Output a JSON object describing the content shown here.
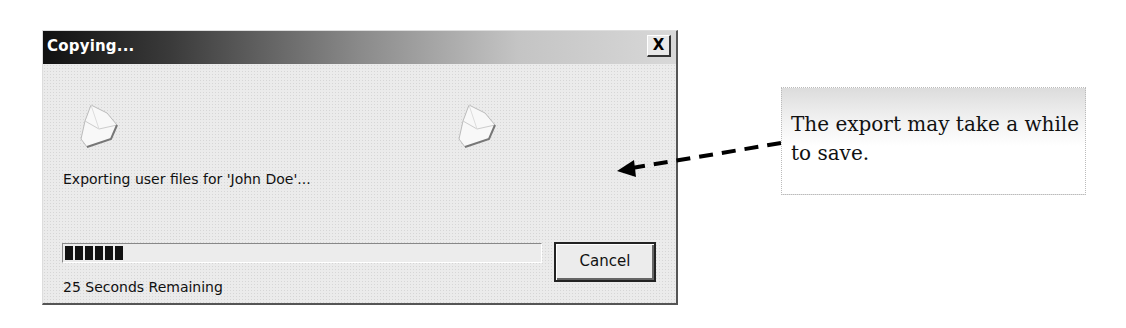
{
  "dialog": {
    "title": "Copying...",
    "close_label": "X",
    "icons": [
      "file-copy-icon",
      "file-copy-icon"
    ],
    "message": "Exporting user files for 'John Doe'...",
    "progress": {
      "blocks_filled": 6,
      "percent": 6
    },
    "time_remaining": "25 Seconds Remaining",
    "cancel_label": "Cancel"
  },
  "callout": {
    "text": "The export may take a while to save."
  },
  "colors": {
    "titlebar_start": "#111111",
    "titlebar_end": "#d8d8d8",
    "dialog_bg": "#ebebeb",
    "progress_block": "#111111"
  }
}
